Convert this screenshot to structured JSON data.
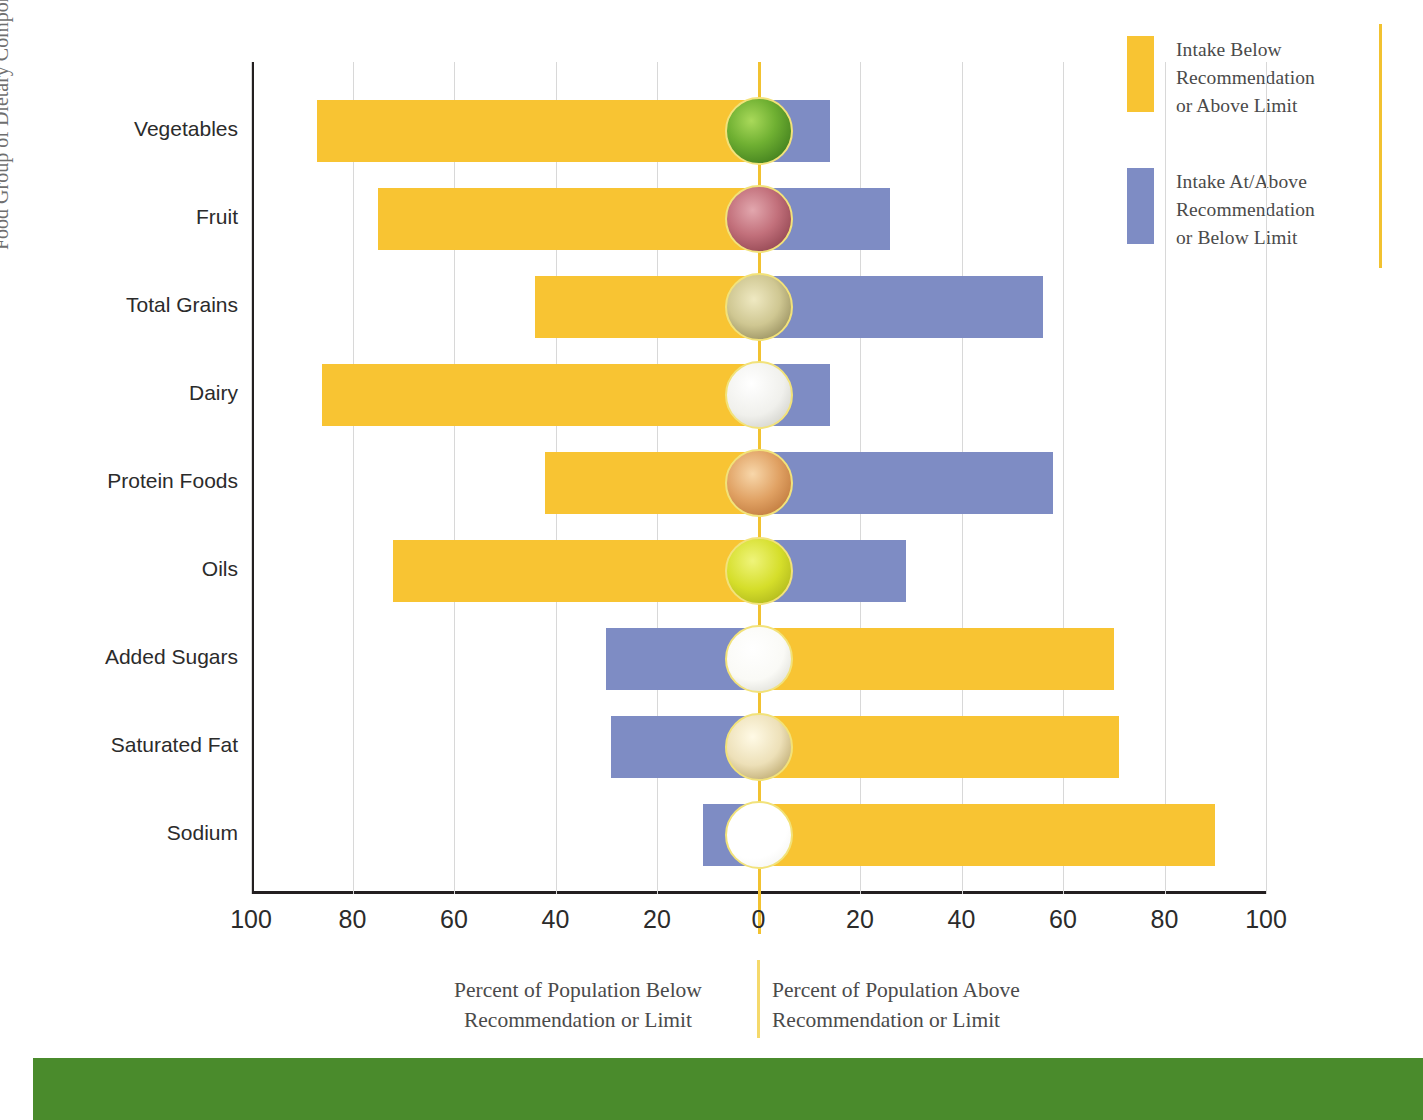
{
  "chart_data": {
    "type": "bar",
    "title": "",
    "subtitle": "",
    "orientation": "horizontal-diverging",
    "xlabel_left": "Percent of Population Below\nRecommendation or Limit",
    "xlabel_right": "Percent of Population Above\nRecommendation or Limit",
    "ylabel": "Food Group of Dietary Component",
    "xlim": [
      -100,
      100
    ],
    "xticks": [
      "100",
      "80",
      "60",
      "40",
      "20",
      "0",
      "20",
      "40",
      "60",
      "80",
      "100"
    ],
    "xtick_values": [
      -100,
      -80,
      -60,
      -40,
      -20,
      0,
      20,
      40,
      60,
      80,
      100
    ],
    "grid": true,
    "legend_position": "right",
    "categories": [
      "Vegetables",
      "Fruit",
      "Total Grains",
      "Dairy",
      "Protein Foods",
      "Oils",
      "Added Sugars",
      "Saturated Fat",
      "Sodium"
    ],
    "series": [
      {
        "name": "Intake Below Recommendation or Above Limit",
        "color": "#F8C433",
        "values": [
          87,
          75,
          44,
          86,
          42,
          72,
          70,
          71,
          90
        ],
        "side": [
          "left",
          "left",
          "left",
          "left",
          "left",
          "left",
          "right",
          "right",
          "right"
        ]
      },
      {
        "name": "Intake At/Above Recommendation or Below Limit",
        "color": "#7E8CC4",
        "values": [
          14,
          26,
          56,
          14,
          58,
          29,
          30,
          29,
          11
        ],
        "side": [
          "right",
          "right",
          "right",
          "right",
          "right",
          "right",
          "left",
          "left",
          "left"
        ]
      }
    ],
    "rows": [
      {
        "label": "Vegetables",
        "yellow": 87,
        "yellow_side": "left",
        "blue": 14,
        "blue_side": "right",
        "icon": "broccoli-icon",
        "icon_colors": [
          "#8CC63F",
          "#3E8A1E",
          "#C6E08A"
        ]
      },
      {
        "label": "Fruit",
        "yellow": 75,
        "yellow_side": "left",
        "blue": 26,
        "blue_side": "right",
        "icon": "raspberry-icon",
        "icon_colors": [
          "#C76B76",
          "#8E3B48",
          "#E0A3AA"
        ]
      },
      {
        "label": "Total Grains",
        "yellow": 44,
        "yellow_side": "left",
        "blue": 56,
        "blue_side": "right",
        "icon": "grains-icon",
        "icon_colors": [
          "#D8D29A",
          "#8A8150",
          "#EFEBC8"
        ]
      },
      {
        "label": "Dairy",
        "yellow": 86,
        "yellow_side": "left",
        "blue": 14,
        "blue_side": "right",
        "icon": "milk-icon",
        "icon_colors": [
          "#F2F2F0",
          "#C9C9C2",
          "#FFFFFF"
        ]
      },
      {
        "label": "Protein Foods",
        "yellow": 42,
        "yellow_side": "left",
        "blue": 58,
        "blue_side": "right",
        "icon": "protein-icon",
        "icon_colors": [
          "#E8A866",
          "#C07032",
          "#F6D2A6"
        ]
      },
      {
        "label": "Oils",
        "yellow": 72,
        "yellow_side": "left",
        "blue": 29,
        "blue_side": "right",
        "icon": "oil-icon",
        "icon_colors": [
          "#D9E22C",
          "#A8B019",
          "#EEF47A"
        ]
      },
      {
        "label": "Added Sugars",
        "yellow": 70,
        "yellow_side": "right",
        "blue": 30,
        "blue_side": "left",
        "icon": "sugar-icon",
        "icon_colors": [
          "#FDFDFB",
          "#D6D6CE",
          "#FFFFFF"
        ]
      },
      {
        "label": "Saturated Fat",
        "yellow": 71,
        "yellow_side": "right",
        "blue": 29,
        "blue_side": "left",
        "icon": "butter-icon",
        "icon_colors": [
          "#F6EFD6",
          "#B9A366",
          "#FFFAE8"
        ]
      },
      {
        "label": "Sodium",
        "yellow": 90,
        "yellow_side": "right",
        "blue": 11,
        "blue_side": "left",
        "icon": "salt-icon",
        "icon_colors": [
          "#FFFFFF",
          "#EFEFEA",
          "#FFFFFF"
        ]
      }
    ]
  },
  "legend": {
    "items": [
      {
        "color": "#F8C433",
        "label": "Intake Below\nRecommendation\nor Above Limit"
      },
      {
        "color": "#7E8CC4",
        "label": "Intake At/Above\nRecommendation\nor Below Limit"
      }
    ]
  },
  "colors": {
    "yellow": "#F8C433",
    "blue": "#7E8CC4",
    "zero_line": "#F2C230",
    "axis": "#231f20",
    "grid": "#d8d8d8",
    "footer_band": "#4A8B2C",
    "text": "#2b2b2b",
    "muted_text": "#6f6f6f"
  }
}
